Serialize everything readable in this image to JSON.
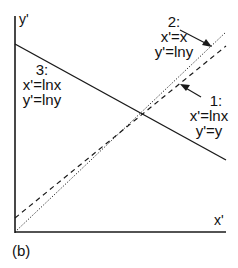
{
  "figure": {
    "panel_label": "(b)",
    "x_axis_label": "x'",
    "y_axis_label": "y'"
  },
  "lines": [
    {
      "id": "1",
      "style": "dashed",
      "label_num": "1:",
      "eq_x": "x'=lnx",
      "eq_y": "y'=y"
    },
    {
      "id": "2",
      "style": "dotted",
      "label_num": "2:",
      "eq_x": "x'=x",
      "eq_y": "y'=lny"
    },
    {
      "id": "3",
      "style": "solid",
      "label_num": "3:",
      "eq_x": "x'=lnx",
      "eq_y": "y'=lny"
    }
  ],
  "colors": {
    "ink": "#1a1a1a",
    "background": "#ffffff"
  }
}
